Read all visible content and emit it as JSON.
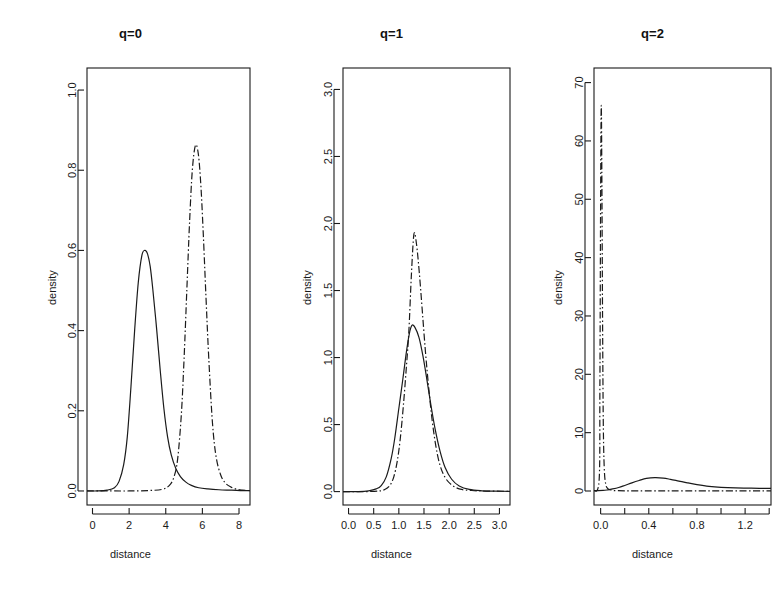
{
  "figure": {
    "background": "#ffffff",
    "line_color": "#1a1a1a",
    "panel_count": 3
  },
  "chart_data": [
    {
      "type": "line",
      "title": "q=0",
      "xlabel": "distance",
      "ylabel": "density",
      "xlim": [
        -0.3,
        8.6
      ],
      "ylim": [
        -0.035,
        1.055
      ],
      "xticks": [
        0,
        2,
        4,
        6,
        8
      ],
      "xticklabels": [
        "0",
        "2",
        "4",
        "6",
        "8"
      ],
      "yticks": [
        0.0,
        0.2,
        0.4,
        0.6,
        0.8,
        1.0
      ],
      "yticklabels": [
        "0.0",
        "0.2",
        "0.4",
        "0.6",
        "0.8",
        "1.0"
      ],
      "grid": false,
      "legend": "none",
      "series": [
        {
          "name": "solid",
          "style": "solid",
          "peak_x": 2.85,
          "peak_y": 0.6,
          "x": [
            -0.3,
            0.3,
            0.8,
            1.2,
            1.45,
            1.7,
            1.9,
            2.1,
            2.3,
            2.5,
            2.7,
            2.85,
            3.0,
            3.15,
            3.3,
            3.5,
            3.7,
            3.9,
            4.1,
            4.3,
            4.55,
            4.8,
            5.1,
            5.4,
            5.8,
            6.3,
            6.9,
            7.6,
            8.2,
            8.6
          ],
          "y": [
            0.0,
            0.0,
            0.002,
            0.008,
            0.024,
            0.065,
            0.135,
            0.26,
            0.4,
            0.52,
            0.588,
            0.6,
            0.592,
            0.56,
            0.5,
            0.405,
            0.3,
            0.205,
            0.135,
            0.09,
            0.056,
            0.036,
            0.022,
            0.014,
            0.008,
            0.005,
            0.003,
            0.002,
            0.001,
            0.001
          ]
        },
        {
          "name": "dashdot",
          "style": "dashdot",
          "peak_x": 5.62,
          "peak_y": 0.86,
          "x": [
            -0.3,
            1.0,
            2.0,
            3.0,
            3.8,
            4.2,
            4.45,
            4.65,
            4.85,
            5.0,
            5.15,
            5.3,
            5.45,
            5.62,
            5.78,
            5.92,
            6.05,
            6.2,
            6.35,
            6.55,
            6.75,
            7.0,
            7.25,
            7.55,
            7.9,
            8.2,
            8.6
          ],
          "y": [
            0.0,
            0.0,
            0.0,
            0.001,
            0.004,
            0.014,
            0.035,
            0.08,
            0.19,
            0.33,
            0.5,
            0.67,
            0.8,
            0.862,
            0.84,
            0.76,
            0.64,
            0.48,
            0.33,
            0.17,
            0.085,
            0.04,
            0.02,
            0.01,
            0.004,
            0.002,
            0.001
          ]
        }
      ]
    },
    {
      "type": "line",
      "title": "q=1",
      "xlabel": "distance",
      "ylabel": "density",
      "xlim": [
        -0.11,
        3.21
      ],
      "ylim": [
        -0.1,
        3.16
      ],
      "xticks": [
        0.0,
        0.5,
        1.0,
        1.5,
        2.0,
        2.5,
        3.0
      ],
      "xticklabels": [
        "0.0",
        "0.5",
        "1.0",
        "1.5",
        "2.0",
        "2.5",
        "3.0"
      ],
      "yticks": [
        0.0,
        0.5,
        1.0,
        1.5,
        2.0,
        2.5,
        3.0
      ],
      "yticklabels": [
        "0.0",
        "0.5",
        "1.0",
        "1.5",
        "2.0",
        "2.5",
        "3.0"
      ],
      "grid": false,
      "legend": "none",
      "series": [
        {
          "name": "solid",
          "style": "solid",
          "peak_x": 1.26,
          "peak_y": 1.24,
          "x": [
            -0.11,
            0.2,
            0.4,
            0.55,
            0.65,
            0.75,
            0.85,
            0.92,
            1.0,
            1.08,
            1.15,
            1.21,
            1.26,
            1.32,
            1.4,
            1.48,
            1.56,
            1.64,
            1.72,
            1.82,
            1.92,
            2.05,
            2.2,
            2.4,
            2.65,
            2.9,
            3.21
          ],
          "y": [
            0.0,
            0.0,
            0.006,
            0.02,
            0.045,
            0.11,
            0.25,
            0.4,
            0.62,
            0.84,
            1.04,
            1.18,
            1.24,
            1.225,
            1.15,
            1.01,
            0.83,
            0.64,
            0.47,
            0.3,
            0.18,
            0.092,
            0.042,
            0.016,
            0.006,
            0.003,
            0.002
          ]
        },
        {
          "name": "dashdot",
          "style": "dashdot",
          "peak_x": 1.3,
          "peak_y": 1.92,
          "x": [
            -0.11,
            0.3,
            0.6,
            0.72,
            0.82,
            0.9,
            0.97,
            1.03,
            1.09,
            1.15,
            1.2,
            1.25,
            1.3,
            1.35,
            1.41,
            1.47,
            1.53,
            1.59,
            1.66,
            1.74,
            1.82,
            1.92,
            2.05,
            2.22,
            2.45,
            2.75,
            3.21
          ],
          "y": [
            0.0,
            0.0,
            0.004,
            0.015,
            0.045,
            0.11,
            0.23,
            0.4,
            0.64,
            0.93,
            1.2,
            1.62,
            1.92,
            1.85,
            1.62,
            1.33,
            1.04,
            0.79,
            0.54,
            0.33,
            0.195,
            0.105,
            0.05,
            0.018,
            0.008,
            0.004,
            0.002
          ]
        }
      ]
    },
    {
      "type": "line",
      "title": "q=2",
      "xlabel": "distance",
      "ylabel": "density",
      "xlim": [
        -0.055,
        1.415
      ],
      "ylim": [
        -2.4,
        72.5
      ],
      "xticks": [
        0.0,
        0.2,
        0.4,
        0.6,
        0.8,
        1.0,
        1.2,
        1.4
      ],
      "xticklabels": [
        "0.0",
        "",
        "0.4",
        "",
        "0.8",
        "",
        "1.2",
        ""
      ],
      "yticks": [
        0,
        10,
        20,
        30,
        40,
        50,
        60,
        70
      ],
      "yticklabels": [
        "0",
        "10",
        "20",
        "30",
        "40",
        "50",
        "60",
        "70"
      ],
      "grid": false,
      "legend": "none",
      "series": [
        {
          "name": "solid",
          "style": "solid",
          "peak_x": 0.45,
          "peak_y": 2.3,
          "x": [
            -0.055,
            0.02,
            0.06,
            0.1,
            0.15,
            0.2,
            0.26,
            0.32,
            0.38,
            0.45,
            0.52,
            0.58,
            0.65,
            0.72,
            0.8,
            0.9,
            1.0,
            1.12,
            1.25,
            1.415
          ],
          "y": [
            0.05,
            0.1,
            0.2,
            0.35,
            0.6,
            0.95,
            1.4,
            1.8,
            2.15,
            2.3,
            2.22,
            2.0,
            1.7,
            1.4,
            1.1,
            0.8,
            0.62,
            0.52,
            0.48,
            0.45
          ]
        },
        {
          "name": "dashdot",
          "style": "dashdot",
          "peak_x": 0.005,
          "peak_y": 66.0,
          "x": [
            -0.055,
            -0.012,
            -0.006,
            0.0,
            0.005,
            0.01,
            0.016,
            0.022,
            0.03,
            0.042,
            0.06,
            0.09,
            0.14,
            0.3,
            0.7,
            1.415
          ],
          "y": [
            0.0,
            2.0,
            18.0,
            50.0,
            66.0,
            55.0,
            30.0,
            12.0,
            4.0,
            1.2,
            0.4,
            0.15,
            0.05,
            0.02,
            0.01,
            0.01
          ]
        }
      ]
    }
  ]
}
